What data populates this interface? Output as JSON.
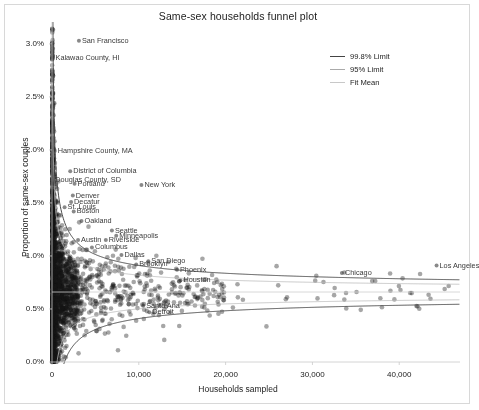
{
  "chart_data": {
    "type": "scatter",
    "title": "Same-sex households funnel plot",
    "xlabel": "Households sampled",
    "ylabel": "Proportion of same-sex couples",
    "xlim": [
      0,
      47000
    ],
    "ylim": [
      0,
      0.0315
    ],
    "grid": false,
    "xticks": [
      0,
      10000,
      20000,
      30000,
      40000
    ],
    "xticklabels": [
      "0",
      "10,000",
      "20,000",
      "30,000",
      "40,000"
    ],
    "yticks": [
      0.0,
      0.005,
      0.01,
      0.015,
      0.02,
      0.025,
      0.03
    ],
    "yticklabels": [
      "0.0%",
      "0.5%",
      "1.0%",
      "1.5%",
      "2.0%",
      "2.5%",
      "3.0%"
    ],
    "fit_mean": 0.0066,
    "legend": {
      "position": "upper right",
      "entries": [
        {
          "label": "99.8% Limit",
          "color": "#444444",
          "width": 1.1
        },
        {
          "label": "95% Limit",
          "color": "#aaaaaa",
          "width": 0.8
        },
        {
          "label": "Fit Mean",
          "color": "#c8c8c8",
          "width": 0.8
        }
      ]
    },
    "point_style": {
      "color": "#1a1a1a",
      "opacity": 0.38,
      "radius": 2.3
    },
    "annotations": [
      {
        "label": "San Francisco",
        "x": 3100,
        "y": 0.0303
      },
      {
        "label": "Kalawao County, HI",
        "x": 60,
        "y": 0.0287
      },
      {
        "label": "Hampshire County, MA",
        "x": 320,
        "y": 0.0199
      },
      {
        "label": "District of Columbia",
        "x": 2100,
        "y": 0.018
      },
      {
        "label": "Douglas County, SD",
        "x": 40,
        "y": 0.0172
      },
      {
        "label": "Portland",
        "x": 2600,
        "y": 0.0168
      },
      {
        "label": "New York",
        "x": 10300,
        "y": 0.0167
      },
      {
        "label": "Denver",
        "x": 2400,
        "y": 0.0157
      },
      {
        "label": "Decatur",
        "x": 2200,
        "y": 0.0151
      },
      {
        "label": "St. Louis",
        "x": 1450,
        "y": 0.0146
      },
      {
        "label": "Boston",
        "x": 2500,
        "y": 0.0142
      },
      {
        "label": "Oakland",
        "x": 3400,
        "y": 0.0133
      },
      {
        "label": "Seattle",
        "x": 6900,
        "y": 0.0124
      },
      {
        "label": "Minneapolis",
        "x": 7400,
        "y": 0.0119
      },
      {
        "label": "Austin",
        "x": 3000,
        "y": 0.0115
      },
      {
        "label": "Riverside",
        "x": 6200,
        "y": 0.0115
      },
      {
        "label": "Columbus",
        "x": 4600,
        "y": 0.0108
      },
      {
        "label": "Dallas",
        "x": 8000,
        "y": 0.0101
      },
      {
        "label": "San Diego",
        "x": 11100,
        "y": 0.0095
      },
      {
        "label": "Brooklyn",
        "x": 9700,
        "y": 0.0092
      },
      {
        "label": "Phoenix",
        "x": 14400,
        "y": 0.0087
      },
      {
        "label": "Chicago",
        "x": 33400,
        "y": 0.0084
      },
      {
        "label": "Los Angeles",
        "x": 44300,
        "y": 0.0091
      },
      {
        "label": "Houston",
        "x": 14800,
        "y": 0.0077
      },
      {
        "label": "Santa Ana",
        "x": 10500,
        "y": 0.0053
      },
      {
        "label": "Detroit",
        "x": 11200,
        "y": 0.0047
      }
    ]
  }
}
